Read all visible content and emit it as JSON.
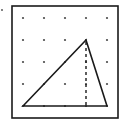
{
  "diagram": {
    "type": "geoboard-triangle",
    "colors": {
      "background": "#ffffff",
      "stroke": "#1a1a1a",
      "dot": "#4a4a4a"
    },
    "marker_dot": {
      "x": 2,
      "y": 10
    },
    "frame": {
      "x": 12,
      "y": 6,
      "width": 106,
      "height": 112
    },
    "grid": {
      "columns": [
        23,
        44,
        65,
        86,
        107
      ],
      "rows": [
        18,
        40,
        62,
        84,
        106
      ]
    },
    "triangle": {
      "vertices": [
        {
          "name": "bottom-left",
          "col": 0,
          "row": 4
        },
        {
          "name": "apex",
          "col": 3,
          "row": 1
        },
        {
          "name": "bottom-right",
          "col": 4,
          "row": 4
        }
      ]
    },
    "altitude": {
      "style": "dashed",
      "from": {
        "col": 3,
        "row": 1
      },
      "to": {
        "col": 3,
        "row": 4
      }
    }
  }
}
